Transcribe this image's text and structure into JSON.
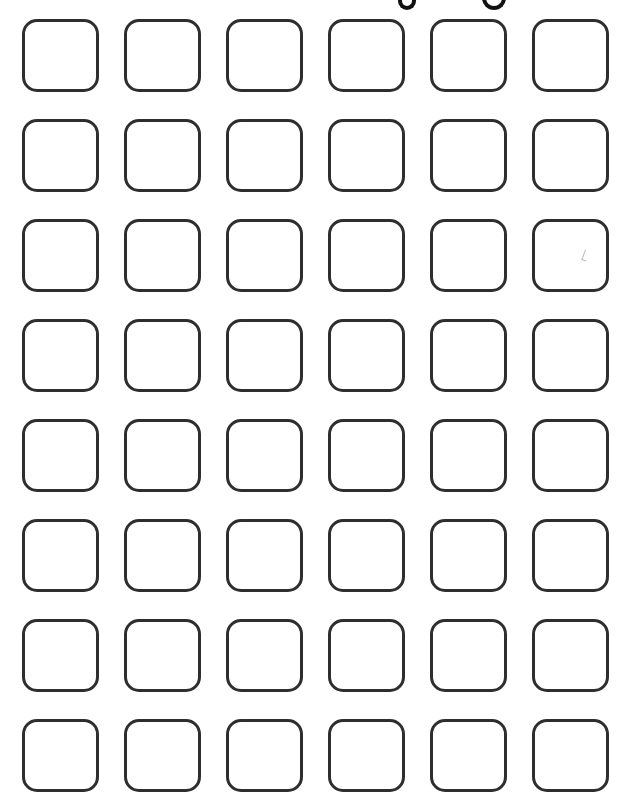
{
  "page": {
    "background": "#ffffff",
    "box_border_color": "#2e2e2e"
  },
  "title": {
    "visible_text": "",
    "note_glyph_tails": [
      "y",
      "g"
    ]
  },
  "grid": {
    "rows": 8,
    "columns": 6,
    "cells": [
      [
        {
          "label": ""
        },
        {
          "label": ""
        },
        {
          "label": ""
        },
        {
          "label": ""
        },
        {
          "label": ""
        },
        {
          "label": ""
        }
      ],
      [
        {
          "label": ""
        },
        {
          "label": ""
        },
        {
          "label": ""
        },
        {
          "label": ""
        },
        {
          "label": ""
        },
        {
          "label": ""
        }
      ],
      [
        {
          "label": ""
        },
        {
          "label": ""
        },
        {
          "label": ""
        },
        {
          "label": ""
        },
        {
          "label": ""
        },
        {
          "label": "",
          "faint_mark": true
        }
      ],
      [
        {
          "label": ""
        },
        {
          "label": ""
        },
        {
          "label": ""
        },
        {
          "label": ""
        },
        {
          "label": ""
        },
        {
          "label": ""
        }
      ],
      [
        {
          "label": ""
        },
        {
          "label": ""
        },
        {
          "label": ""
        },
        {
          "label": ""
        },
        {
          "label": ""
        },
        {
          "label": ""
        }
      ],
      [
        {
          "label": ""
        },
        {
          "label": ""
        },
        {
          "label": ""
        },
        {
          "label": ""
        },
        {
          "label": ""
        },
        {
          "label": ""
        }
      ],
      [
        {
          "label": ""
        },
        {
          "label": ""
        },
        {
          "label": ""
        },
        {
          "label": ""
        },
        {
          "label": ""
        },
        {
          "label": ""
        }
      ],
      [
        {
          "label": ""
        },
        {
          "label": ""
        },
        {
          "label": ""
        },
        {
          "label": ""
        },
        {
          "label": ""
        },
        {
          "label": ""
        }
      ]
    ]
  }
}
